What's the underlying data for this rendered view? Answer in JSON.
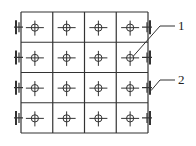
{
  "diagram": {
    "type": "grid-panel-layout",
    "rows": 4,
    "cols": 4,
    "grid": {
      "x0": 21,
      "y0": 12,
      "x1": 148,
      "y1": 133
    },
    "stroke_color": "#333333",
    "callouts": [
      {
        "id": "1",
        "label": "1",
        "target": "center-symbol",
        "target_cell": [
          1,
          3
        ],
        "text_x": 178,
        "text_y": 30
      },
      {
        "id": "2",
        "label": "2",
        "target": "side-bracket",
        "target_row": 2,
        "side": "right",
        "text_x": 178,
        "text_y": 84
      }
    ]
  }
}
